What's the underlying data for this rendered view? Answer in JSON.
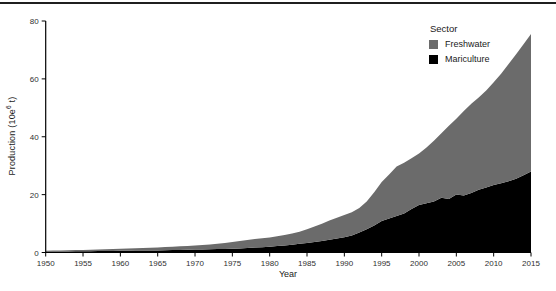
{
  "figure": {
    "top_rule_color": "#1f1f1f",
    "background": "#ffffff"
  },
  "chart_data": {
    "type": "area",
    "stacked": true,
    "title": "",
    "xlabel": "Year",
    "ylabel": "Production (10e6 t)",
    "ylabel_parts": {
      "prefix": "Production (10e",
      "sup": "6",
      "suffix": " t)"
    },
    "xlim": [
      1950,
      2015
    ],
    "ylim": [
      0,
      80
    ],
    "x_ticks": [
      1950,
      1955,
      1960,
      1965,
      1970,
      1975,
      1980,
      1985,
      1990,
      1995,
      2000,
      2005,
      2010,
      2015
    ],
    "y_ticks": [
      0,
      20,
      40,
      60,
      80
    ],
    "grid": false,
    "axis_color": "#000000",
    "tick_label_color": "#303030",
    "legend": {
      "title": "Sector",
      "position": "inside-top-right",
      "entries": [
        {
          "label": "Freshwater",
          "color": "#6b6b6b"
        },
        {
          "label": "Mariculture",
          "color": "#000000"
        }
      ]
    },
    "years": [
      1950,
      1951,
      1952,
      1953,
      1954,
      1955,
      1956,
      1957,
      1958,
      1959,
      1960,
      1961,
      1962,
      1963,
      1964,
      1965,
      1966,
      1967,
      1968,
      1969,
      1970,
      1971,
      1972,
      1973,
      1974,
      1975,
      1976,
      1977,
      1978,
      1979,
      1980,
      1981,
      1982,
      1983,
      1984,
      1985,
      1986,
      1987,
      1988,
      1989,
      1990,
      1991,
      1992,
      1993,
      1994,
      1995,
      1996,
      1997,
      1998,
      1999,
      2000,
      2001,
      2002,
      2003,
      2004,
      2005,
      2006,
      2007,
      2008,
      2009,
      2010,
      2011,
      2012,
      2013,
      2014,
      2015
    ],
    "series": [
      {
        "name": "Mariculture",
        "color": "#000000",
        "values": [
          0.3,
          0.32,
          0.34,
          0.37,
          0.4,
          0.43,
          0.46,
          0.49,
          0.52,
          0.55,
          0.58,
          0.61,
          0.64,
          0.67,
          0.7,
          0.74,
          0.78,
          0.82,
          0.87,
          0.93,
          1.0,
          1.05,
          1.1,
          1.16,
          1.22,
          1.3,
          1.4,
          1.53,
          1.68,
          1.83,
          2.0,
          2.2,
          2.45,
          2.7,
          3.0,
          3.3,
          3.65,
          4.0,
          4.4,
          4.85,
          5.3,
          5.9,
          6.9,
          8.0,
          9.3,
          10.9,
          11.8,
          12.6,
          13.5,
          15.0,
          16.4,
          17.0,
          17.6,
          18.9,
          18.5,
          20.0,
          19.7,
          20.6,
          21.7,
          22.5,
          23.3,
          23.9,
          24.6,
          25.5,
          26.7,
          28.0
        ]
      },
      {
        "name": "Freshwater",
        "color": "#6b6b6b",
        "values": [
          0.3,
          0.33,
          0.36,
          0.39,
          0.43,
          0.47,
          0.51,
          0.55,
          0.6,
          0.65,
          0.7,
          0.76,
          0.82,
          0.88,
          0.95,
          1.02,
          1.1,
          1.18,
          1.26,
          1.34,
          1.45,
          1.57,
          1.7,
          1.84,
          2.03,
          2.3,
          2.55,
          2.82,
          3.02,
          3.12,
          3.2,
          3.4,
          3.6,
          3.85,
          4.2,
          4.7,
          5.3,
          5.95,
          6.65,
          7.15,
          7.7,
          8.0,
          8.5,
          9.6,
          11.5,
          13.5,
          15.2,
          17.1,
          17.5,
          17.6,
          17.8,
          19.3,
          21.0,
          22.3,
          25.3,
          26.2,
          29.2,
          30.8,
          31.9,
          33.5,
          35.5,
          37.9,
          40.5,
          43.0,
          45.3,
          47.5
        ]
      }
    ],
    "stack_order_bottom_to_top": [
      "Mariculture",
      "Freshwater"
    ]
  }
}
